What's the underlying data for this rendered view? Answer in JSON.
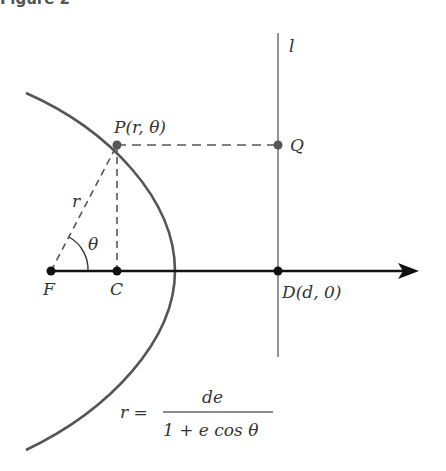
{
  "figure": {
    "title": "Figure 2"
  },
  "labels": {
    "P": "P(r, θ)",
    "Q": "Q",
    "l": "l",
    "r": "r",
    "theta": "θ",
    "F": "F",
    "C": "C",
    "D": "D(d, 0)"
  },
  "equation": {
    "lhs": "r =",
    "numerator": "de",
    "denominator": "1 + e cos θ"
  },
  "colors": {
    "curve": "#555555",
    "axis": "#111111",
    "directrix": "#888888",
    "dashed": "#555555"
  }
}
